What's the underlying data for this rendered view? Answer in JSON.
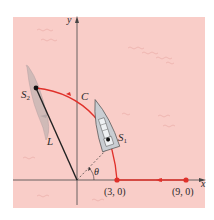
{
  "figure": {
    "background_color": "#f9cdc8",
    "curve_color": "#e0302a",
    "axis_color": "#333333"
  },
  "axes": {
    "x_label": "x",
    "y_label": "y"
  },
  "labels": {
    "s2": "S",
    "s2_sub": "2",
    "s1": "S",
    "s1_sub": "1",
    "curve": "C",
    "line": "L",
    "angle": "θ",
    "point_a": "(3, 0)",
    "point_b": "(9, 0)"
  },
  "points": [
    {
      "name": "point_a",
      "coords": [
        3,
        0
      ]
    },
    {
      "name": "point_b",
      "coords": [
        9,
        0
      ]
    }
  ]
}
